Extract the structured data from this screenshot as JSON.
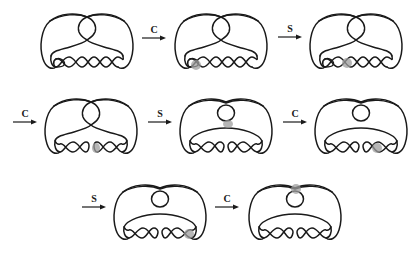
{
  "figure": {
    "highlight_color": "#9e9e9e",
    "stroke_color": "#1a1a1a",
    "moves": [
      {
        "label": "C"
      },
      {
        "label": "S"
      },
      {
        "label": "C"
      },
      {
        "label": "S"
      },
      {
        "label": "C"
      },
      {
        "label": "S"
      },
      {
        "label": "C"
      }
    ],
    "diagrams": [
      {
        "index": 1,
        "variant": "twisted-top-5",
        "highlight": null
      },
      {
        "index": 2,
        "variant": "twisted-top-5",
        "highlight": "lower-left twist crossing"
      },
      {
        "index": 3,
        "variant": "twisted-top-5",
        "highlight": "second twist crossing"
      },
      {
        "index": 4,
        "variant": "twisted-top-smoothed",
        "highlight": "middle twist (smoothed)"
      },
      {
        "index": 5,
        "variant": "loop-top",
        "highlight": "crossing below top loop"
      },
      {
        "index": 6,
        "variant": "loop-top",
        "highlight": "fourth twist crossing"
      },
      {
        "index": 7,
        "variant": "loop-top",
        "highlight": "right-end twist crossing"
      },
      {
        "index": 8,
        "variant": "loop-top",
        "highlight": "top crossing above loop"
      }
    ]
  }
}
